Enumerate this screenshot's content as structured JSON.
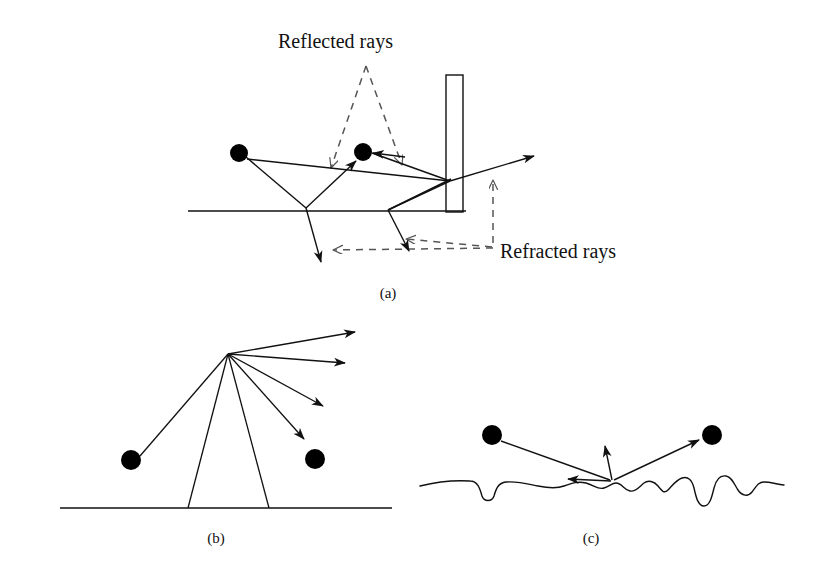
{
  "figure": {
    "caption_labels": {
      "panel_a": "(a)",
      "panel_b": "(b)",
      "panel_c": "(c)"
    },
    "annotations": {
      "reflected": "Reflected rays",
      "refracted": "Refracted rays"
    },
    "colors": {
      "ink": "#111111",
      "node_fill": "#000000",
      "dashed_ray": "#555555",
      "background": "#ffffff"
    },
    "panels": [
      {
        "id": "a",
        "label": "(a)",
        "description": "Specular reflection and refraction at a flat surface with a vertical occluder",
        "ground_line": {
          "x1": 188,
          "y1": 211,
          "x2": 466,
          "y2": 211
        },
        "wall": {
          "x": 446,
          "y": 75,
          "width": 17,
          "height": 137
        },
        "nodes": [
          {
            "name": "source-node",
            "cx": 239,
            "cy": 153,
            "r": 9
          },
          {
            "name": "receiver-node",
            "cx": 363,
            "cy": 152,
            "r": 9
          }
        ],
        "solid_rays": [
          {
            "name": "incident-ray-left",
            "points": "246,157 306,208",
            "arrow": false
          },
          {
            "name": "reflected-ray-to-receiver",
            "points": "306,208 357,160",
            "arrow": true
          },
          {
            "name": "incident-ray-long",
            "points": "246,158 449,180",
            "arrow": false
          },
          {
            "name": "transmitted-ray-exit",
            "points": "449,180 536,155",
            "arrow": true
          },
          {
            "name": "ray-from-receiver-right",
            "points": "372,152 449,180",
            "arrow": false
          },
          {
            "name": "ray-wall-to-ground",
            "points": "449,180 388,210",
            "arrow": false
          },
          {
            "name": "ray-ground-to-wall",
            "points": "388,210 450,178",
            "arrow": false
          },
          {
            "name": "refracted-ray-left",
            "points": "306,208 322,265",
            "arrow": true
          },
          {
            "name": "refracted-ray-right",
            "points": "388,210 410,253",
            "arrow": true
          },
          {
            "name": "arrow-into-receiver",
            "points": "404,156 371,152",
            "arrow": true
          }
        ],
        "dashed_annotations": [
          {
            "name": "reflected-pointer-left",
            "points": "366,66 330,170",
            "arrow": true
          },
          {
            "name": "reflected-pointer-right",
            "points": "366,66 404,167",
            "arrow": true
          },
          {
            "name": "refracted-pointer-up",
            "points": "493,243 493,178",
            "arrow": true
          },
          {
            "name": "refracted-pointer-far-left",
            "points": "493,248 330,250",
            "arrow": true
          },
          {
            "name": "refracted-pointer-mid",
            "points": "493,248 403,238",
            "arrow": true
          }
        ]
      },
      {
        "id": "b",
        "label": "(b)",
        "description": "Diffuse scattering fan from a single surface point on a flat surface",
        "ground_line": {
          "x1": 60,
          "y1": 508,
          "x2": 392,
          "y2": 508
        },
        "hub": {
          "x": 228,
          "y": 354
        },
        "nodes": [
          {
            "name": "source-node",
            "cx": 131,
            "cy": 460,
            "r": 10
          },
          {
            "name": "receiver-node",
            "cx": 315,
            "cy": 459,
            "r": 10
          }
        ],
        "plain_lines": [
          {
            "name": "ray-hub-to-source",
            "points": "228,354 140,455"
          },
          {
            "name": "ray-hub-to-ground-left",
            "points": "228,354 188,508"
          },
          {
            "name": "ray-hub-to-ground-right",
            "points": "228,354 269,508"
          }
        ],
        "arrow_rays": [
          {
            "name": "scatter-ray-1",
            "points": "228,354 357,331"
          },
          {
            "name": "scatter-ray-2",
            "points": "228,354 347,363"
          },
          {
            "name": "scatter-ray-3",
            "points": "228,354 325,407"
          },
          {
            "name": "scatter-ray-4",
            "points": "228,354 306,441"
          }
        ]
      },
      {
        "id": "c",
        "label": "(c)",
        "description": "Scattering from a rough (wavy) surface",
        "hub": {
          "x": 613,
          "y": 482
        },
        "surface_baseline_y": 483,
        "nodes": [
          {
            "name": "source-node",
            "cx": 492,
            "cy": 435,
            "r": 10
          },
          {
            "name": "receiver-node",
            "cx": 712,
            "cy": 435,
            "r": 10
          }
        ],
        "plain_lines": [
          {
            "name": "incident-ray-from-source",
            "points": "501,440 610,480"
          }
        ],
        "arrow_rays": [
          {
            "name": "scatter-ray-left",
            "points": "611,481 570,479"
          },
          {
            "name": "scatter-ray-up",
            "points": "612,480 606,444"
          },
          {
            "name": "scatter-ray-to-receiver",
            "points": "614,480 701,439"
          }
        ],
        "rough_surface_path": "M 420,486 C 440,481 455,480 470,481 C 478,481 480,489 482,496 C 484,502 492,502 494,496 C 496,489 498,483 506,482 C 518,481 528,484 538,486 C 548,488 556,489 564,486 C 572,483 578,481 586,483 C 594,485 598,490 604,488 C 610,486 612,483 616,483 C 622,483 624,490 630,491 C 636,492 640,486 644,483 C 648,480 654,481 658,486 C 662,491 664,494 668,490 C 672,486 676,480 682,478 C 688,476 692,480 694,488 C 696,497 698,506 704,506 C 710,506 712,496 714,488 C 716,480 720,475 726,476 C 732,477 734,484 738,490 C 742,496 748,497 752,492 C 756,487 758,482 764,482 C 770,482 776,484 784,485"
      }
    ]
  }
}
